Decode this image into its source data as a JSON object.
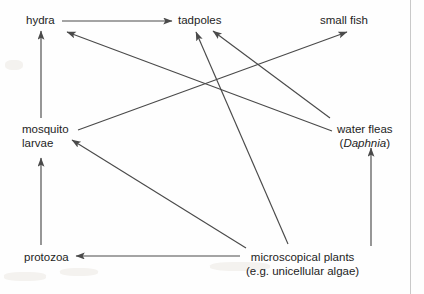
{
  "diagram": {
    "type": "food-web",
    "line_color": "#4a4a4a",
    "text_color": "#1d1d1d",
    "background": "#ffffff",
    "nodes": [
      {
        "id": "hydra",
        "label": "hydra",
        "label_line2": "",
        "x": 26,
        "y": 14
      },
      {
        "id": "tadpoles",
        "label": "tadpoles",
        "label_line2": "",
        "x": 178,
        "y": 14
      },
      {
        "id": "small_fish",
        "label": "small fish",
        "label_line2": "",
        "x": 320,
        "y": 14
      },
      {
        "id": "mosquito",
        "label": "mosquito",
        "label_line2": "larvae",
        "x": 22,
        "y": 123
      },
      {
        "id": "waterfleas",
        "label": "water fleas",
        "label_line2": "(Daphnia)",
        "x": 337,
        "y": 123
      },
      {
        "id": "protozoa",
        "label": "protozoa",
        "label_line2": "",
        "x": 24,
        "y": 251
      },
      {
        "id": "plants",
        "label": "microscopical plants",
        "label_line2": "(e.g. unicellular algae)",
        "x": 246,
        "y": 251
      }
    ],
    "edges": [
      {
        "from": "hydra",
        "to": "tadpoles",
        "x1": 62,
        "y1": 21,
        "x2": 172,
        "y2": 21
      },
      {
        "from": "mosquito",
        "to": "hydra",
        "x1": 41,
        "y1": 118,
        "x2": 41,
        "y2": 31
      },
      {
        "from": "protozoa",
        "to": "mosquito",
        "x1": 41,
        "y1": 245,
        "x2": 41,
        "y2": 158
      },
      {
        "from": "plants",
        "to": "protozoa",
        "x1": 240,
        "y1": 256,
        "x2": 76,
        "y2": 256
      },
      {
        "from": "plants",
        "to": "waterfleas",
        "x1": 371,
        "y1": 246,
        "x2": 371,
        "y2": 148
      },
      {
        "from": "plants",
        "to": "tadpoles",
        "x1": 288,
        "y1": 244,
        "x2": 196,
        "y2": 32
      },
      {
        "from": "plants",
        "to": "mosquito",
        "x1": 246,
        "y1": 248,
        "x2": 72,
        "y2": 140
      },
      {
        "from": "waterfleas",
        "to": "tadpoles",
        "x1": 330,
        "y1": 118,
        "x2": 213,
        "y2": 31
      },
      {
        "from": "waterfleas",
        "to": "hydra",
        "x1": 332,
        "y1": 131,
        "x2": 67,
        "y2": 32
      },
      {
        "from": "mosquito",
        "to": "small_fish",
        "x1": 78,
        "y1": 130,
        "x2": 347,
        "y2": 32
      }
    ]
  }
}
